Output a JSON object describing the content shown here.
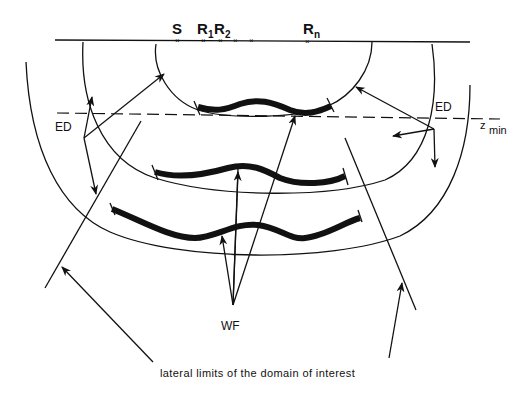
{
  "diagram": {
    "surface_labels": {
      "source": "S",
      "receiver_1": "R",
      "receiver_1_sub": "1",
      "receiver_2": "R",
      "receiver_2_sub": "2",
      "receiver_n": "R",
      "receiver_n_sub": "n"
    },
    "ed_left": "ED",
    "ed_right": "ED",
    "z_min": "z",
    "z_min_sub": "min",
    "wf_label": "WF",
    "caption": "lateral limits of the domain of interest",
    "colors": {
      "line": "#111111",
      "background": "#ffffff"
    }
  }
}
